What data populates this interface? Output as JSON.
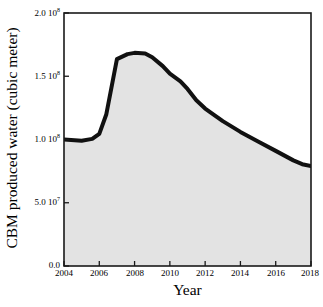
{
  "chart_data": {
    "type": "area",
    "title": "",
    "xlabel": "Year",
    "ylabel": "CBM produced water (cubic meter)",
    "xlim": [
      2004,
      2018
    ],
    "ylim": [
      0,
      200000000
    ],
    "grid": false,
    "legend": null,
    "fill_color": "#e3e3e3",
    "line_color": "#111111",
    "line_width_px": 4,
    "x_ticks": [
      "2004",
      "2006",
      "2008",
      "2010",
      "2012",
      "2014",
      "2016",
      "2018"
    ],
    "x_tick_values": [
      2004,
      2006,
      2008,
      2010,
      2012,
      2014,
      2016,
      2018
    ],
    "y_ticks": [
      {
        "value": 0,
        "mantissa": "0.0",
        "exponent": ""
      },
      {
        "value": 50000000,
        "mantissa": "5.0 10",
        "exponent": "7"
      },
      {
        "value": 100000000,
        "mantissa": "1.0 10",
        "exponent": "8"
      },
      {
        "value": 150000000,
        "mantissa": "1.5 10",
        "exponent": "8"
      },
      {
        "value": 200000000,
        "mantissa": "2.0 10",
        "exponent": "8"
      }
    ],
    "x": [
      2004,
      2005,
      2005.6,
      2006,
      2006.4,
      2007,
      2007.6,
      2008,
      2008.6,
      2009,
      2009.6,
      2010,
      2010.6,
      2011,
      2011.5,
      2012,
      2013,
      2014,
      2015,
      2016,
      2017,
      2017.5,
      2018
    ],
    "values": [
      100000000,
      99000000,
      100500000,
      104500000,
      120000000,
      163500000,
      167500000,
      168500000,
      168000000,
      165000000,
      158000000,
      152000000,
      146000000,
      140000000,
      131000000,
      124500000,
      114500000,
      106000000,
      98500000,
      91000000,
      83500000,
      80500000,
      79000000
    ],
    "series": [
      {
        "name": "CBM produced water",
        "points": [
          {
            "year": 2004,
            "value": 100000000
          },
          {
            "year": 2005,
            "value": 99000000
          },
          {
            "year": 2006,
            "value": 104500000
          },
          {
            "year": 2007,
            "value": 163500000
          },
          {
            "year": 2008,
            "value": 168500000
          },
          {
            "year": 2009,
            "value": 165000000
          },
          {
            "year": 2010,
            "value": 152000000
          },
          {
            "year": 2011,
            "value": 140000000
          },
          {
            "year": 2012,
            "value": 124500000
          },
          {
            "year": 2013,
            "value": 114500000
          },
          {
            "year": 2014,
            "value": 106000000
          },
          {
            "year": 2015,
            "value": 98500000
          },
          {
            "year": 2016,
            "value": 91000000
          },
          {
            "year": 2017,
            "value": 83500000
          },
          {
            "year": 2018,
            "value": 79000000
          }
        ]
      }
    ]
  }
}
